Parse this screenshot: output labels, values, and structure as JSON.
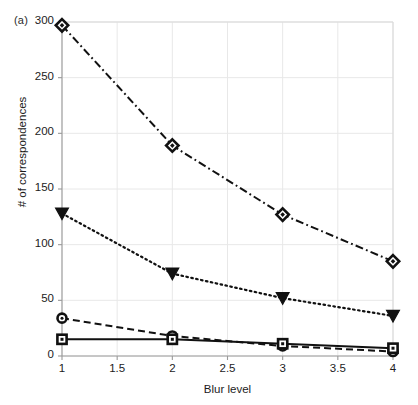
{
  "figure": {
    "panel_label": "(a)",
    "background_color": "#ffffff",
    "grid_color": "#e8e8e8",
    "axis_color": "#9a9a9a",
    "series_color": "#111111"
  },
  "chart_data": {
    "type": "line",
    "title": "",
    "subtitle": "",
    "xlabel": "Blur level",
    "ylabel": "# of correspondences",
    "x": [
      1,
      2,
      3,
      4
    ],
    "xlim": [
      1,
      4
    ],
    "ylim": [
      0,
      300
    ],
    "xticks": [
      1,
      1.5,
      2,
      2.5,
      3,
      3.5,
      4
    ],
    "xtick_labels": [
      "1",
      "1.5",
      "2",
      "2.5",
      "3",
      "3.5",
      "4"
    ],
    "yticks": [
      0,
      50,
      100,
      150,
      200,
      250,
      300
    ],
    "ytick_labels": [
      "0",
      "50",
      "100",
      "150",
      "200",
      "250",
      "300"
    ],
    "grid": true,
    "legend": null,
    "legend_position": "none",
    "annotations": [
      "(a)"
    ],
    "series": [
      {
        "name": "series-1",
        "marker": "diamond",
        "linestyle": "dashdot",
        "values": [
          297,
          189,
          127,
          85
        ]
      },
      {
        "name": "series-2",
        "marker": "triangle-down",
        "linestyle": "dotted",
        "values": [
          128,
          74,
          52,
          36
        ]
      },
      {
        "name": "series-3",
        "marker": "circle",
        "linestyle": "dashed",
        "values": [
          34,
          18,
          9,
          4
        ]
      },
      {
        "name": "series-4",
        "marker": "square",
        "linestyle": "solid",
        "values": [
          15,
          15,
          11,
          7
        ]
      }
    ]
  }
}
